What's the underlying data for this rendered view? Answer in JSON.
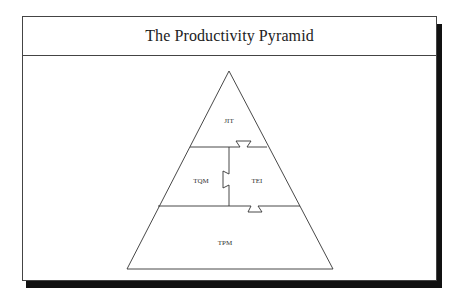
{
  "header": {
    "title": "The Productivity Pyramid"
  },
  "diagram": {
    "type": "pyramid",
    "levels": [
      {
        "id": "top",
        "label": "JIT"
      },
      {
        "id": "middle-left",
        "label": "TQM"
      },
      {
        "id": "middle-right",
        "label": "TEI"
      },
      {
        "id": "base",
        "label": "TPM"
      }
    ],
    "colors": {
      "line": "#333333",
      "fill": "#ffffff",
      "shadow": "#111111"
    }
  }
}
